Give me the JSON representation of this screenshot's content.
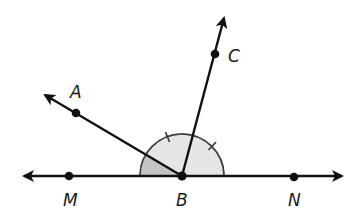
{
  "diagram": {
    "type": "geometry-angles",
    "colors": {
      "line": "#111111",
      "arc_light": "#e6e6e6",
      "arc_dark": "#c4c4c4",
      "label": "#1a1a1a"
    },
    "points": [
      {
        "name": "M",
        "label": "M"
      },
      {
        "name": "B",
        "label": "B"
      },
      {
        "name": "N",
        "label": "N"
      },
      {
        "name": "A",
        "label": "A"
      },
      {
        "name": "C",
        "label": "C"
      }
    ],
    "rays": [
      "BA",
      "BC"
    ],
    "line": "MN",
    "congruent_angles": [
      "ABC",
      "CBN"
    ],
    "shaded_angle": "MBA"
  }
}
